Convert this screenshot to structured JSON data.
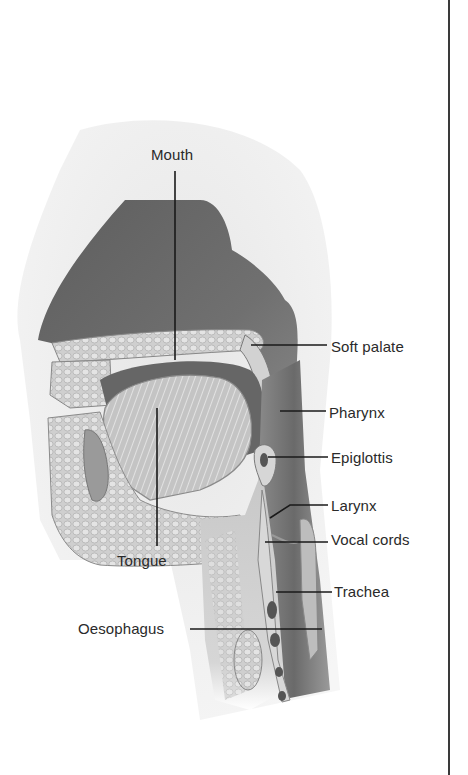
{
  "diagram": {
    "labels": [
      {
        "id": "mouth",
        "text": "Mouth",
        "x": 151,
        "y": 147
      },
      {
        "id": "soft-palate",
        "text": "Soft palate",
        "x": 331,
        "y": 339
      },
      {
        "id": "pharynx",
        "text": "Pharynx",
        "x": 329,
        "y": 405
      },
      {
        "id": "epiglottis",
        "text": "Epiglottis",
        "x": 331,
        "y": 450
      },
      {
        "id": "larynx",
        "text": "Larynx",
        "x": 331,
        "y": 498
      },
      {
        "id": "vocal-cords",
        "text": "Vocal cords",
        "x": 331,
        "y": 532
      },
      {
        "id": "tongue",
        "text": "Tongue",
        "x": 117,
        "y": 553
      },
      {
        "id": "trachea",
        "text": "Trachea",
        "x": 334,
        "y": 584
      },
      {
        "id": "oesophagus",
        "text": "Oesophagus",
        "x": 78,
        "y": 597
      }
    ],
    "leader_lines": [
      {
        "label": "mouth",
        "x1": 175,
        "y1": 171,
        "x2": 175,
        "y2": 360
      },
      {
        "label": "soft-palate",
        "x1": 251,
        "y1": 345,
        "x2": 327,
        "y2": 345
      },
      {
        "label": "pharynx",
        "x1": 280,
        "y1": 411,
        "x2": 326,
        "y2": 411
      },
      {
        "label": "epiglottis",
        "x1": 268,
        "y1": 457,
        "x2": 328,
        "y2": 457
      },
      {
        "label": "larynx",
        "x1": 270,
        "y1": 518,
        "x2": 290,
        "y2": 505,
        "x3": 328,
        "y3": 505
      },
      {
        "label": "vocal-cords",
        "x1": 265,
        "y1": 542,
        "x2": 328,
        "y2": 542
      },
      {
        "label": "tongue",
        "x1": 157,
        "y1": 408,
        "x2": 157,
        "y2": 546
      },
      {
        "label": "trachea",
        "x1": 276,
        "y1": 592,
        "x2": 332,
        "y2": 592
      },
      {
        "label": "oesophagus",
        "x1": 190,
        "y1": 629,
        "x2": 322,
        "y2": 629
      }
    ],
    "colors": {
      "background": "#ffffff",
      "label_text": "#2a2a2a",
      "leader_line": "#1a1a1a",
      "nasal_cavity": "#6e6e6e",
      "face_skin": "#d8d8d8",
      "tissue_light": "#c9c9c9",
      "tissue_mid": "#a8a8a8",
      "airway_dark": "#5a5a5a",
      "border_rule": "#3a3a3a"
    }
  }
}
